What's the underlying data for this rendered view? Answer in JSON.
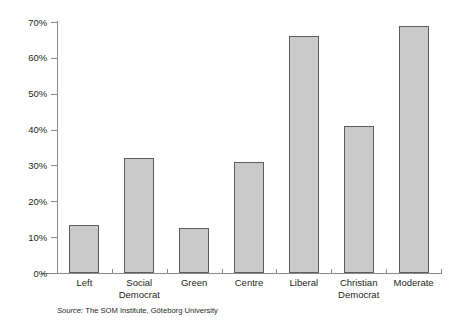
{
  "chart_data": {
    "type": "bar",
    "title": "",
    "subtitle": "",
    "xlabel": "",
    "ylabel": "",
    "categories": [
      "Left",
      "Social Democrat",
      "Green",
      "Centre",
      "Liberal",
      "Christian Democrat",
      "Moderate"
    ],
    "category_lines": [
      [
        "Left"
      ],
      [
        "Social",
        "Democrat"
      ],
      [
        "Green"
      ],
      [
        "Centre"
      ],
      [
        "Liberal"
      ],
      [
        "Christian",
        "Democrat"
      ],
      [
        "Moderate"
      ]
    ],
    "values": [
      13.5,
      32,
      12.5,
      31,
      66,
      41,
      69
    ],
    "ylim": [
      0,
      70
    ],
    "ytick_values": [
      0,
      10,
      20,
      30,
      40,
      50,
      60,
      70
    ],
    "ytick_labels": [
      "0%",
      "10%",
      "20%",
      "30%",
      "40%",
      "50%",
      "60%",
      "70%"
    ],
    "grid": false,
    "legend": "none",
    "bar_fill": "#c9c9c9",
    "bar_border": "#5d5d5d",
    "axis_color": "#8a8a8a"
  },
  "source": {
    "prefix": "Source:",
    "text": "The SOM Institute, Göteborg University"
  }
}
